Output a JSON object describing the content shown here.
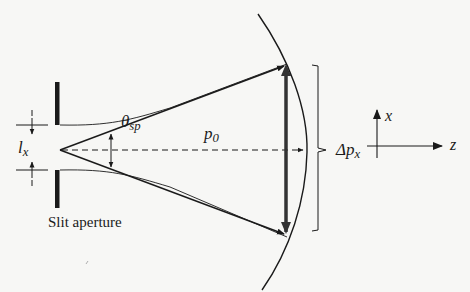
{
  "figure": {
    "caption": "Slit aperture",
    "labels": {
      "slit_width": {
        "main": "l",
        "sub": "x"
      },
      "spread_angle": {
        "main": "θ",
        "sub": "sp"
      },
      "momentum": {
        "main": "p",
        "sub": "0"
      },
      "momentum_spread": {
        "main": "Δp",
        "sub": "x"
      },
      "axis_x": "x",
      "axis_z": "z"
    },
    "colors": {
      "ink": "#1a1a1a",
      "background": "#f7f7f5",
      "momentum_bar": "#333333"
    }
  }
}
